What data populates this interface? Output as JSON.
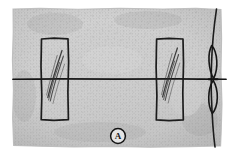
{
  "figure": {
    "panel_label": "A",
    "kind": "scanned-halftone-micrograph-diagram",
    "canvas": {
      "width": 233,
      "height": 155
    },
    "background_color": "#ffffff",
    "field_color": "#d2d2d2",
    "field_shadow_color": "#bdbdbd",
    "ink_color": "#1a1a1a",
    "grain_color": "#a8a8a8",
    "specimen_field": {
      "name": "textured-gray-field",
      "description": "irregular torn-edge rectangular halftone field",
      "left": 12,
      "top": 8,
      "right": 222,
      "bottom": 147
    },
    "baseline": {
      "name": "horizontal-reference-line",
      "y": 79,
      "x_start": 13,
      "x_end": 226,
      "stroke_width": 1.6
    },
    "rectangles": [
      {
        "id": "left",
        "name": "left-marked-rectangle",
        "x": 41,
        "y": 38,
        "width": 27,
        "height": 82,
        "striation_count": 5,
        "striation_direction": "upper-right-to-lower-left"
      },
      {
        "id": "right",
        "name": "right-marked-rectangle",
        "x": 156,
        "y": 38,
        "width": 27,
        "height": 82,
        "striation_count": 5,
        "striation_direction": "upper-right-to-lower-left"
      }
    ],
    "right_edge_feature": {
      "name": "vertical-edge-contour",
      "description": "curved vertical contour along right border with two lens-shaped eyelets meeting the baseline",
      "x_top": 214,
      "x_bottom": 212,
      "lens_upper": {
        "cy": 62,
        "rx": 6,
        "ry": 17
      },
      "lens_lower": {
        "cy": 96,
        "rx": 6,
        "ry": 17
      }
    },
    "caption": {
      "name": "panel-letter-A",
      "text": "A",
      "cx": 118,
      "cy": 136,
      "radius": 7.5
    }
  }
}
